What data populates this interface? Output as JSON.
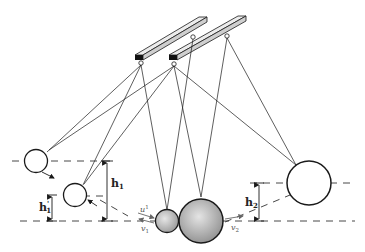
{
  "diagram": {
    "labels": {
      "h1": {
        "main": "h",
        "sub": "1"
      },
      "h1_prime": {
        "main": "h",
        "sub": "1",
        "prime": "'"
      },
      "h2": {
        "main": "h",
        "sub": "2"
      },
      "u1": {
        "main": "u",
        "sub": "1"
      },
      "v1": {
        "main": "v",
        "sub": "1"
      },
      "v2": {
        "main": "v",
        "sub": "2"
      }
    },
    "elements": [
      "left-support-beam",
      "right-support-beam",
      "small-sphere-start",
      "small-sphere-rebound",
      "small-sphere-impact",
      "large-sphere-impact",
      "large-sphere-final"
    ],
    "colors": {
      "line": "#1a1a1a",
      "beam_face": "#d8d8d8",
      "beam_end": "#111111",
      "sphere_shade": "#c8c8c8",
      "dash": "#333333"
    }
  }
}
